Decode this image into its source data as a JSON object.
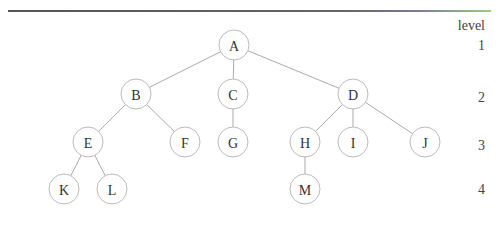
{
  "diagram": {
    "type": "tree",
    "level_header": "level",
    "levels": [
      {
        "label": "1",
        "y": 45
      },
      {
        "label": "2",
        "y": 97
      },
      {
        "label": "3",
        "y": 145
      },
      {
        "label": "4",
        "y": 189
      }
    ],
    "nodes": [
      {
        "id": "A",
        "label": "A",
        "x": 234,
        "y": 45,
        "level": 1
      },
      {
        "id": "B",
        "label": "B",
        "x": 136,
        "y": 94,
        "level": 2
      },
      {
        "id": "C",
        "label": "C",
        "x": 233,
        "y": 94,
        "level": 2
      },
      {
        "id": "D",
        "label": "D",
        "x": 353,
        "y": 94,
        "level": 2
      },
      {
        "id": "E",
        "label": "E",
        "x": 88,
        "y": 142,
        "level": 3
      },
      {
        "id": "F",
        "label": "F",
        "x": 185,
        "y": 142,
        "level": 3
      },
      {
        "id": "G",
        "label": "G",
        "x": 233,
        "y": 142,
        "level": 3
      },
      {
        "id": "H",
        "label": "H",
        "x": 305,
        "y": 142,
        "level": 3
      },
      {
        "id": "I",
        "label": "I",
        "x": 353,
        "y": 142,
        "level": 3
      },
      {
        "id": "J",
        "label": "J",
        "x": 425,
        "y": 142,
        "level": 3
      },
      {
        "id": "K",
        "label": "K",
        "x": 64,
        "y": 189,
        "level": 4
      },
      {
        "id": "L",
        "label": "L",
        "x": 112,
        "y": 189,
        "level": 4
      },
      {
        "id": "M",
        "label": "M",
        "x": 305,
        "y": 189,
        "level": 4
      }
    ],
    "edges": [
      [
        "A",
        "B"
      ],
      [
        "A",
        "C"
      ],
      [
        "A",
        "D"
      ],
      [
        "B",
        "E"
      ],
      [
        "B",
        "F"
      ],
      [
        "C",
        "G"
      ],
      [
        "D",
        "H"
      ],
      [
        "D",
        "I"
      ],
      [
        "D",
        "J"
      ],
      [
        "E",
        "K"
      ],
      [
        "E",
        "L"
      ],
      [
        "H",
        "M"
      ]
    ],
    "node_radius": 15
  }
}
